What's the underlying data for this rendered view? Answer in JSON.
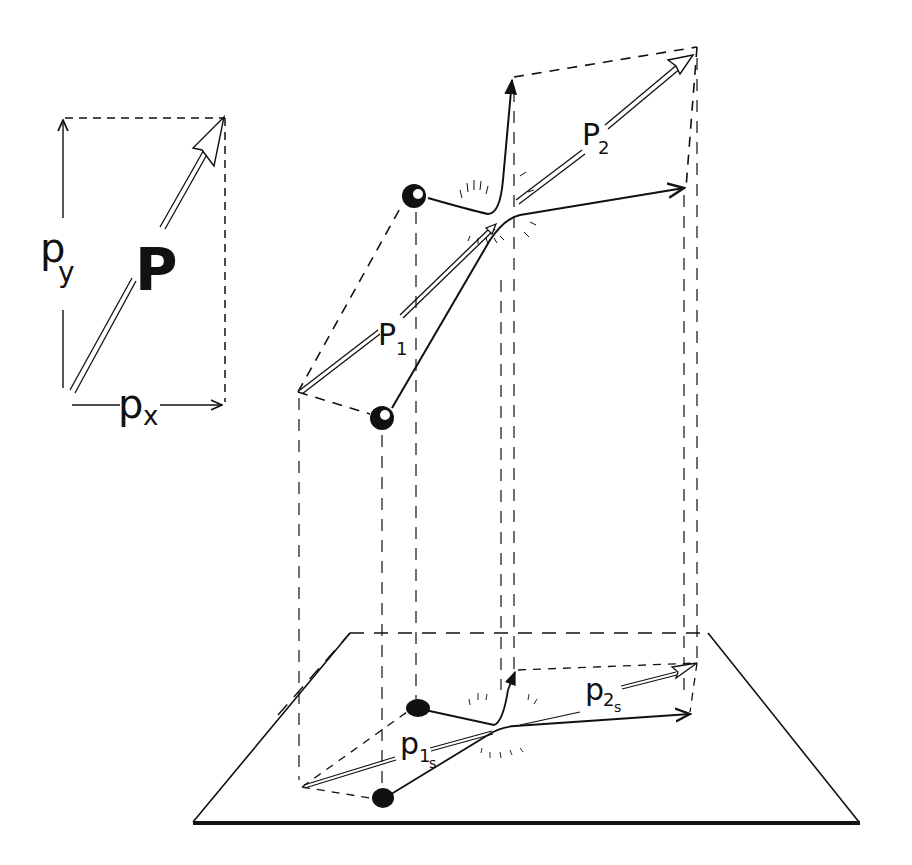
{
  "diagram": {
    "title": "",
    "stroke_color": "#111111",
    "background": "#ffffff",
    "inset": {
      "vector_label": "P",
      "x_component_label": "p",
      "x_component_sub": "x",
      "y_component_label": "p",
      "y_component_sub": "y"
    },
    "collision": {
      "incoming_momentum_label": "P",
      "incoming_momentum_sub": "1",
      "outgoing_momentum_label": "P",
      "outgoing_momentum_sub": "2"
    },
    "projection": {
      "incoming_label": "p",
      "incoming_sub": "1",
      "incoming_subsub": "s",
      "outgoing_label": "p",
      "outgoing_sub": "2",
      "outgoing_subsub": "s"
    }
  }
}
